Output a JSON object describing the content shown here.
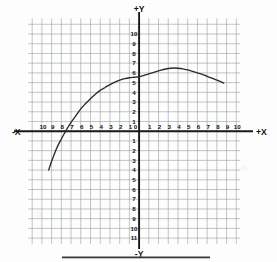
{
  "figure": {
    "kind": "coordinate-grid-plot",
    "paper_color": "#fdfdfd",
    "grid_color": "#9aa0a6",
    "axis_color": "#1a1a1a",
    "curve_color": "#2a2a2a",
    "label_color": "#111111"
  },
  "axes": {
    "x_positive_label": "+X",
    "x_negative_label": "-X",
    "y_positive_label": "+Y",
    "y_negative_label": "-Y",
    "x_ticks_negative": [
      "10",
      "9",
      "8",
      "7",
      "6",
      "5",
      "4",
      "3",
      "2",
      "1"
    ],
    "x_origin_label": "0",
    "x_ticks_positive": [
      "1",
      "2",
      "3",
      "4",
      "5",
      "6",
      "7",
      "8",
      "9",
      "10"
    ],
    "y_ticks_positive": [
      "10",
      "9",
      "8",
      "7",
      "6",
      "5",
      "4",
      "3",
      "2",
      "1"
    ],
    "y_ticks_negative": [
      "1",
      "2",
      "3",
      "4",
      "5",
      "6",
      "7",
      "8",
      "9",
      "10",
      "11"
    ]
  },
  "chart_data": {
    "type": "line",
    "title": "",
    "xlabel": "+X",
    "ylabel": "+Y",
    "xlim": [
      -11.4,
      10.4
    ],
    "ylim": [
      -11.6,
      11.6
    ],
    "grid": true,
    "grid_step": 1,
    "legend": "none",
    "series": [
      {
        "name": "curve",
        "x": [
          -9.3,
          -9.0,
          -8.5,
          -8.0,
          -7.5,
          -7.0,
          -6.5,
          -6.0,
          -5.5,
          -5.0,
          -4.5,
          -4.0,
          -3.5,
          -3.0,
          -2.5,
          -2.0,
          -1.5,
          -1.0,
          -0.5,
          0.0,
          0.5,
          1.0,
          1.5,
          2.0,
          2.5,
          3.0,
          3.5,
          4.0,
          4.5,
          5.0,
          5.5,
          6.0,
          6.5,
          7.0,
          7.5,
          8.0,
          8.5,
          8.7
        ],
        "y": [
          -4.0,
          -3.1,
          -1.8,
          -0.8,
          0.1,
          0.9,
          1.6,
          2.3,
          2.85,
          3.35,
          3.8,
          4.2,
          4.5,
          4.8,
          5.05,
          5.25,
          5.4,
          5.5,
          5.55,
          5.6,
          5.75,
          5.9,
          6.05,
          6.2,
          6.35,
          6.45,
          6.5,
          6.48,
          6.42,
          6.3,
          6.15,
          6.0,
          5.85,
          5.65,
          5.45,
          5.25,
          5.05,
          4.95
        ]
      }
    ],
    "annotations": {
      "x_intercept_approx": -7.55,
      "y_intercept_approx": 5.6,
      "vertex_approx": [
        3.5,
        6.5
      ],
      "left_endpoint": [
        -9.3,
        -4.0
      ],
      "right_endpoint": [
        8.7,
        4.95
      ]
    }
  },
  "artifacts": {
    "bottom_bar": "scan-edge-bar"
  }
}
